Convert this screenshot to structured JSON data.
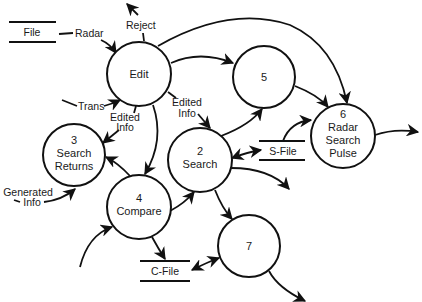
{
  "diagram": {
    "type": "data-flow-diagram",
    "processes": [
      {
        "id": "edit",
        "number": "",
        "name": "Edit",
        "lines": [
          "Edit"
        ]
      },
      {
        "id": "2",
        "number": "2",
        "name": "Search",
        "lines": [
          "2",
          "Search"
        ]
      },
      {
        "id": "3",
        "number": "3",
        "name": "Search Returns",
        "lines": [
          "3",
          "Search",
          "Returns"
        ]
      },
      {
        "id": "4",
        "number": "4",
        "name": "Compare",
        "lines": [
          "4",
          "Compare"
        ]
      },
      {
        "id": "5",
        "number": "5",
        "name": "",
        "lines": [
          "5"
        ]
      },
      {
        "id": "6",
        "number": "6",
        "name": "Radar Search Pulse",
        "lines": [
          "6",
          "Radar",
          "Search",
          "Pulse"
        ]
      },
      {
        "id": "7",
        "number": "7",
        "name": "",
        "lines": [
          "7"
        ]
      }
    ],
    "data_stores": [
      {
        "id": "file",
        "label": "File"
      },
      {
        "id": "s-file",
        "label": "S-File"
      },
      {
        "id": "c-file",
        "label": "C-File"
      }
    ],
    "flow_labels": {
      "radar": "Radar",
      "reject": "Reject",
      "trans": "Trans",
      "edited_info_left": [
        "Edited",
        "Info"
      ],
      "edited_info_right": [
        "Edited",
        "Info"
      ],
      "generated_info": [
        "Generated",
        "Info"
      ]
    },
    "flows": [
      {
        "from": "file",
        "to": "edit",
        "label": "Radar"
      },
      {
        "from": "edit",
        "to": "external",
        "label": "Reject"
      },
      {
        "from": "external",
        "to": "edit",
        "label": "Trans"
      },
      {
        "from": "edit",
        "to": "3",
        "label": "Edited Info"
      },
      {
        "from": "edit",
        "to": "2",
        "label": "Edited Info"
      },
      {
        "from": "edit",
        "to": "4",
        "label": ""
      },
      {
        "from": "edit",
        "to": "5",
        "label": ""
      },
      {
        "from": "edit",
        "to": "6",
        "label": ""
      },
      {
        "from": "5",
        "to": "6",
        "label": ""
      },
      {
        "from": "2",
        "to": "5",
        "label": ""
      },
      {
        "from": "2",
        "to": "s-file",
        "label": "",
        "bidirectional": true
      },
      {
        "from": "s-file",
        "to": "6",
        "label": ""
      },
      {
        "from": "2",
        "to": "external",
        "label": ""
      },
      {
        "from": "2",
        "to": "7",
        "label": ""
      },
      {
        "from": "4",
        "to": "2",
        "label": ""
      },
      {
        "from": "4",
        "to": "3",
        "label": ""
      },
      {
        "from": "4",
        "to": "c-file",
        "label": ""
      },
      {
        "from": "external",
        "to": "4",
        "label": ""
      },
      {
        "from": "external",
        "to": "3",
        "label": "Generated Info"
      },
      {
        "from": "7",
        "to": "c-file",
        "label": "",
        "bidirectional": true
      },
      {
        "from": "7",
        "to": "external",
        "label": ""
      },
      {
        "from": "6",
        "to": "external",
        "label": ""
      }
    ],
    "colors": {
      "stroke": "#111111",
      "background": "#ffffff",
      "text": "#1a1a1a"
    }
  }
}
